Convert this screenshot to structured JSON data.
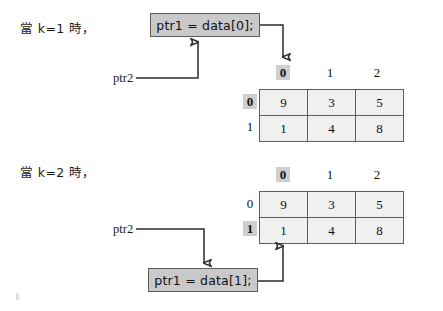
{
  "figure": {
    "colors": {
      "box_fill": "#c9c9c9",
      "box_border": "#5d5d5d",
      "cell_fill": "#f0f0f0",
      "cell_border": "#5d5d5d",
      "highlight": "#cfcfcf",
      "wire": "#2b2b2b",
      "text": "#111111",
      "background": "#ffffff"
    }
  },
  "panels": [
    {
      "id": "k1",
      "caption": "當 k=1 時，",
      "code_statement": "ptr1 = data[0];",
      "pointer_label": "ptr2",
      "table": {
        "column_headers": [
          "0",
          "1",
          "2"
        ],
        "row_headers": [
          "0",
          "1"
        ],
        "highlighted_column": "0",
        "highlighted_row": "0",
        "rows": [
          [
            "9",
            "3",
            "5"
          ],
          [
            "1",
            "4",
            "8"
          ]
        ]
      }
    },
    {
      "id": "k2",
      "caption": "當 k=2 時，",
      "code_statement": "ptr1 = data[1];",
      "pointer_label": "ptr2",
      "table": {
        "column_headers": [
          "0",
          "1",
          "2"
        ],
        "row_headers": [
          "0",
          "1"
        ],
        "highlighted_column": "0",
        "highlighted_row": "1",
        "rows": [
          [
            "9",
            "3",
            "5"
          ],
          [
            "1",
            "4",
            "8"
          ]
        ]
      }
    }
  ]
}
